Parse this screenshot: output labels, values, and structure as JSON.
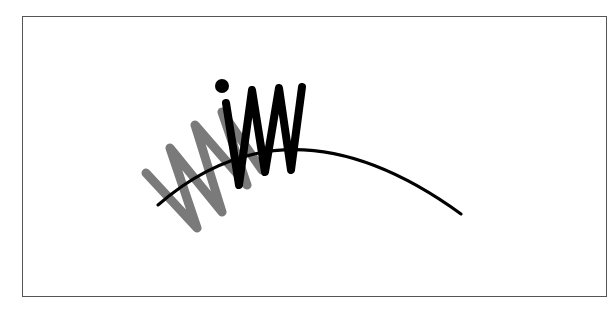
{
  "figure": {
    "colors": {
      "frame": "#555555",
      "arc": "#000000",
      "black_zigzag": "#000000",
      "gray_zigzag": "#7a7a7a",
      "background": "#ffffff"
    },
    "arc": {
      "start": [
        158,
        205
      ],
      "control": [
        290,
        90
      ],
      "end": [
        461,
        214
      ]
    },
    "gray_zigzag_points": [
      [
        146,
        173
      ],
      [
        197,
        228
      ],
      [
        170,
        148
      ],
      [
        222,
        212
      ],
      [
        195,
        125
      ],
      [
        247,
        185
      ],
      [
        222,
        112
      ],
      [
        262,
        170
      ]
    ],
    "black_zigzag_points": [
      [
        226,
        103
      ],
      [
        239,
        185
      ],
      [
        252,
        90
      ],
      [
        265,
        172
      ],
      [
        279,
        88
      ],
      [
        291,
        170
      ],
      [
        302,
        87
      ]
    ],
    "dot": {
      "cx": 222,
      "cy": 86,
      "r": 7
    }
  }
}
